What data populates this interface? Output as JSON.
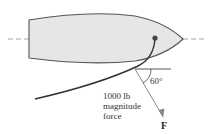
{
  "diagram": {
    "angle_label": "60°",
    "force_description": [
      "1000 lb",
      "magnitude",
      "force"
    ],
    "force_symbol": "F",
    "colors": {
      "hull_fill": "#e6e6e6",
      "hull_stroke": "#555555",
      "rope": "#333333",
      "dashed_axis": "#aaaaaa",
      "force_arrow": "#888888",
      "attachment_point": "#444444"
    }
  }
}
